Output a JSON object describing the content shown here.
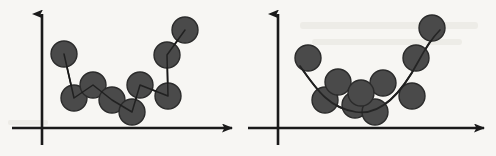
{
  "figure": {
    "width": 496,
    "height": 156,
    "background_color": "#f7f6f3",
    "ink_color": "#1a1a1a",
    "marker_fill": "#4a4a4a",
    "marker_stroke": "#2b2b2b",
    "marker_radius": 13,
    "marker_count_total": 19,
    "panel_count": 2,
    "caption": ""
  },
  "chart_data": [
    {
      "type": "scatter",
      "title": "",
      "subtitle": "",
      "xlabel": "",
      "ylabel": "",
      "panel_label": "",
      "legend": [],
      "legend_position": "none",
      "grid": false,
      "axis_style": "arrow-headed two-axis (x and y), no tick marks, no tick labels",
      "xlim": [
        0,
        10
      ],
      "ylim": [
        0,
        10
      ],
      "x_axis_pixel_y": 128,
      "y_axis_pixel_x": 42,
      "fit": {
        "name": "piecewise-linear interpolation",
        "description": "straight line segments connecting every point in x-order; passes exactly through all points (overfit)",
        "style": "solid",
        "color": "#1a1a1a",
        "width": 1.6
      },
      "points": [
        {
          "x": 1.3,
          "y": 6.9,
          "px": 64,
          "py": 54
        },
        {
          "x": 1.9,
          "y": 2.6,
          "px": 74,
          "py": 98
        },
        {
          "x": 3.0,
          "y": 3.9,
          "px": 93,
          "py": 85
        },
        {
          "x": 4.1,
          "y": 2.5,
          "px": 112,
          "py": 100
        },
        {
          "x": 5.3,
          "y": 1.3,
          "px": 132,
          "py": 112
        },
        {
          "x": 5.8,
          "y": 4.0,
          "px": 140,
          "py": 85
        },
        {
          "x": 7.5,
          "y": 2.9,
          "px": 168,
          "py": 96
        },
        {
          "x": 7.4,
          "y": 7.0,
          "px": 167,
          "py": 55
        },
        {
          "x": 8.5,
          "y": 9.4,
          "px": 185,
          "py": 30
        }
      ]
    },
    {
      "type": "scatter",
      "title": "",
      "subtitle": "",
      "xlabel": "",
      "ylabel": "",
      "panel_label": "",
      "legend": [],
      "legend_position": "none",
      "grid": false,
      "axis_style": "arrow-headed two-axis (x and y), no tick marks, no tick labels",
      "xlim": [
        0,
        10
      ],
      "ylim": [
        0,
        10
      ],
      "x_axis_pixel_y": 128,
      "y_axis_pixel_x": 278,
      "fit": {
        "name": "smooth quadratic curve",
        "description": "U-shaped best-fit curve through the cloud of points; does not pass through every point",
        "style": "solid",
        "color": "#1a1a1a",
        "width": 1.8
      },
      "points": [
        {
          "x": 1.4,
          "y": 6.4,
          "px": 308,
          "py": 58
        },
        {
          "x": 2.3,
          "y": 2.2,
          "px": 325,
          "py": 100
        },
        {
          "x": 2.9,
          "y": 4.0,
          "px": 338,
          "py": 82
        },
        {
          "x": 3.8,
          "y": 2.0,
          "px": 355,
          "py": 105
        },
        {
          "x": 4.8,
          "y": 1.3,
          "px": 375,
          "py": 112
        },
        {
          "x": 5.2,
          "y": 3.9,
          "px": 383,
          "py": 83
        },
        {
          "x": 6.7,
          "y": 2.9,
          "px": 412,
          "py": 96
        },
        {
          "x": 6.9,
          "y": 6.8,
          "px": 416,
          "py": 58
        },
        {
          "x": 7.7,
          "y": 9.8,
          "px": 432,
          "py": 28
        },
        {
          "x": 4.1,
          "y": 3.1,
          "px": 361,
          "py": 93
        }
      ]
    }
  ],
  "panels": {
    "left": {
      "name": "interpolation-scatter-panel",
      "description": "scatter points joined by straight zigzag segments"
    },
    "right": {
      "name": "regression-scatter-panel",
      "description": "scatter points with a smooth fitted curve"
    }
  }
}
